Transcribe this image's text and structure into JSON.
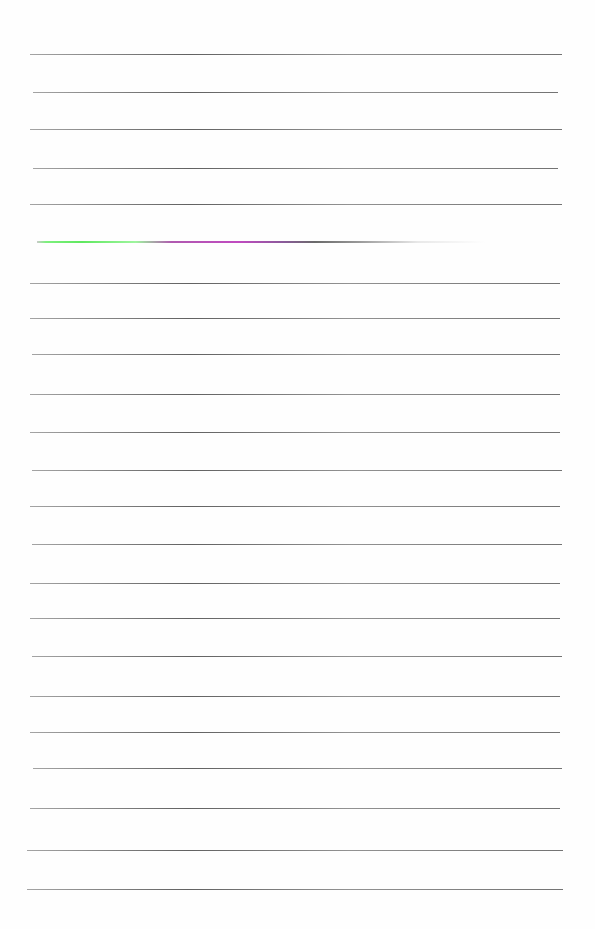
{
  "document": {
    "type": "lined-paper",
    "background_color": "#fefefe",
    "rule_color": "#555555",
    "rules": [
      {
        "y": 54,
        "x1": 30,
        "x2": 562
      },
      {
        "y": 92,
        "x1": 33,
        "x2": 558
      },
      {
        "y": 129,
        "x1": 30,
        "x2": 562
      },
      {
        "y": 168,
        "x1": 33,
        "x2": 558
      },
      {
        "y": 204,
        "x1": 30,
        "x2": 562
      },
      {
        "y": 241,
        "x1": 37,
        "x2": 485,
        "colored": true
      },
      {
        "y": 283,
        "x1": 30,
        "x2": 560
      },
      {
        "y": 318,
        "x1": 30,
        "x2": 560
      },
      {
        "y": 354,
        "x1": 32,
        "x2": 560
      },
      {
        "y": 394,
        "x1": 30,
        "x2": 560
      },
      {
        "y": 432,
        "x1": 30,
        "x2": 560
      },
      {
        "y": 470,
        "x1": 32,
        "x2": 562
      },
      {
        "y": 506,
        "x1": 30,
        "x2": 560
      },
      {
        "y": 544,
        "x1": 32,
        "x2": 562
      },
      {
        "y": 583,
        "x1": 30,
        "x2": 560
      },
      {
        "y": 618,
        "x1": 30,
        "x2": 560
      },
      {
        "y": 656,
        "x1": 32,
        "x2": 562
      },
      {
        "y": 696,
        "x1": 30,
        "x2": 560
      },
      {
        "y": 732,
        "x1": 30,
        "x2": 560
      },
      {
        "y": 768,
        "x1": 33,
        "x2": 562
      },
      {
        "y": 808,
        "x1": 30,
        "x2": 560
      },
      {
        "y": 850,
        "x1": 27,
        "x2": 563
      },
      {
        "y": 889,
        "x1": 27,
        "x2": 563
      }
    ],
    "highlight_colors": [
      "#5fe85f",
      "#c04ac0"
    ]
  }
}
